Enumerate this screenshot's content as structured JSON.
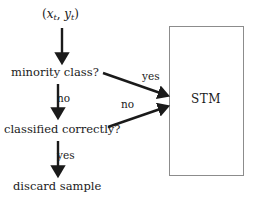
{
  "diagram": {
    "background_color": "#ffffff",
    "stroke_color": "#1a1a1a",
    "box_stroke_color": "#8c8c8c",
    "nodes": {
      "input": {
        "open_paren": "(",
        "x_var": "x",
        "x_sub": "t",
        "comma": ", ",
        "y_var": "y",
        "y_sub": "t",
        "close_paren": ")",
        "plain": "(x_t, y_t)"
      },
      "minority": "minority class?",
      "classified": "classified correctly?",
      "discard": "discard sample",
      "stm": "STM"
    },
    "edge_labels": {
      "minority_no": "no",
      "classified_yes": "yes",
      "minority_yes": "yes",
      "classified_no": "no"
    }
  }
}
